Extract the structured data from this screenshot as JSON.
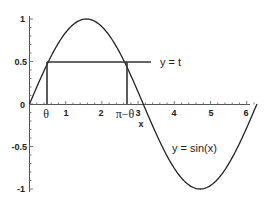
{
  "chart_data": {
    "type": "line",
    "title": "",
    "xlabel": "x",
    "ylabel": "",
    "xlim": [
      0,
      6.3
    ],
    "ylim": [
      -1,
      1
    ],
    "grid": false,
    "x_ticks": [
      "1",
      "2",
      "3",
      "4",
      "5",
      "6"
    ],
    "y_ticks": [
      "1",
      "0.5",
      "0",
      "-0.5",
      "-1"
    ],
    "series": [
      {
        "name": "y = sin(x)",
        "function": "sin(x)",
        "x_range": [
          0,
          6.283
        ]
      },
      {
        "name": "y = t",
        "function": "constant",
        "value": 0.5,
        "x_range": [
          0.5236,
          3.3
        ]
      }
    ],
    "annotations": [
      {
        "text": "θ",
        "x": 0.5236,
        "note": "vertical segment from y=0 to y=t"
      },
      {
        "text": "π−θ",
        "x": 2.618,
        "note": "vertical segment from y=0 to y=t"
      },
      {
        "text": "y = t",
        "position": "right of horizontal line"
      },
      {
        "text": "y = sin(x)",
        "position": "inside trough"
      }
    ]
  },
  "labels": {
    "theta": "θ",
    "pi_minus_theta": "π−θ",
    "y_eq_t": "y = t",
    "y_eq_sin": "y = sin(x)",
    "x_axis": "x",
    "xtick_1": "1",
    "xtick_2": "2",
    "xtick_3": "3",
    "xtick_4": "4",
    "xtick_5": "5",
    "xtick_6": "6",
    "ytick_1": "1",
    "ytick_05": "0.5",
    "ytick_0": "0",
    "ytick_m05": "-0.5",
    "ytick_m1": "-1"
  }
}
